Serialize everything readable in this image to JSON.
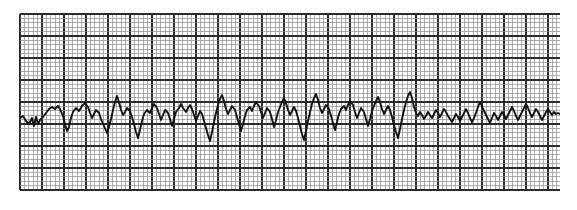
{
  "image": {
    "kind": "ecg-rhythm-strip",
    "width": 577,
    "height": 210,
    "background_color": "#ffffff"
  },
  "grid": {
    "label": "ECG graph paper grid",
    "x": 20,
    "y": 14,
    "width": 540,
    "height": 176,
    "small_square_px": 4.4,
    "heavy_every_n_squares": 5,
    "paper_color": "#ffffff",
    "fine_line_color": "#8c8c8c",
    "heavy_line_color": "#2b2b2b",
    "fine_line_width": 0.7,
    "heavy_line_width": 1.3,
    "time_per_small_square_s": 0.04,
    "time_per_heavy_square_s": 0.2,
    "mv_per_small_square": 0.1,
    "mv_per_heavy_square": 0.5
  },
  "trace": {
    "label": "ECG waveform trace",
    "color": "#121212",
    "line_width": 1.9,
    "baseline_y": 118,
    "rhythm": "irregularly irregular, no discernible P waves (coarse atrial fibrillation)",
    "points": [
      [
        20,
        118
      ],
      [
        23,
        116
      ],
      [
        26,
        121
      ],
      [
        29,
        124
      ],
      [
        32,
        118
      ],
      [
        34,
        126
      ],
      [
        36,
        117
      ],
      [
        38,
        124
      ],
      [
        40,
        120
      ],
      [
        43,
        117
      ],
      [
        46,
        113
      ],
      [
        49,
        109
      ],
      [
        52,
        107
      ],
      [
        55,
        109
      ],
      [
        58,
        106
      ],
      [
        60,
        109
      ],
      [
        63,
        116
      ],
      [
        65,
        124
      ],
      [
        67,
        131
      ],
      [
        69,
        127
      ],
      [
        71,
        118
      ],
      [
        73,
        112
      ],
      [
        76,
        108
      ],
      [
        79,
        111
      ],
      [
        82,
        106
      ],
      [
        85,
        103
      ],
      [
        88,
        107
      ],
      [
        90,
        113
      ],
      [
        92,
        118
      ],
      [
        94,
        114
      ],
      [
        96,
        110
      ],
      [
        99,
        113
      ],
      [
        101,
        119
      ],
      [
        104,
        126
      ],
      [
        107,
        133
      ],
      [
        109,
        127
      ],
      [
        111,
        119
      ],
      [
        113,
        110
      ],
      [
        115,
        102
      ],
      [
        117,
        96
      ],
      [
        119,
        102
      ],
      [
        121,
        110
      ],
      [
        123,
        115
      ],
      [
        125,
        112
      ],
      [
        127,
        108
      ],
      [
        130,
        111
      ],
      [
        132,
        117
      ],
      [
        134,
        124
      ],
      [
        136,
        132
      ],
      [
        138,
        138
      ],
      [
        140,
        130
      ],
      [
        142,
        121
      ],
      [
        144,
        114
      ],
      [
        147,
        110
      ],
      [
        150,
        113
      ],
      [
        152,
        108
      ],
      [
        154,
        104
      ],
      [
        157,
        108
      ],
      [
        159,
        114
      ],
      [
        161,
        120
      ],
      [
        163,
        115
      ],
      [
        165,
        110
      ],
      [
        168,
        113
      ],
      [
        170,
        119
      ],
      [
        172,
        126
      ],
      [
        174,
        119
      ],
      [
        176,
        112
      ],
      [
        179,
        108
      ],
      [
        181,
        104
      ],
      [
        183,
        108
      ],
      [
        186,
        112
      ],
      [
        188,
        108
      ],
      [
        190,
        105
      ],
      [
        192,
        109
      ],
      [
        194,
        115
      ],
      [
        196,
        121
      ],
      [
        198,
        116
      ],
      [
        200,
        111
      ],
      [
        202,
        114
      ],
      [
        204,
        121
      ],
      [
        206,
        128
      ],
      [
        208,
        135
      ],
      [
        210,
        141
      ],
      [
        212,
        132
      ],
      [
        214,
        122
      ],
      [
        216,
        113
      ],
      [
        218,
        105
      ],
      [
        220,
        99
      ],
      [
        222,
        95
      ],
      [
        224,
        101
      ],
      [
        226,
        109
      ],
      [
        228,
        114
      ],
      [
        230,
        110
      ],
      [
        232,
        106
      ],
      [
        235,
        110
      ],
      [
        237,
        117
      ],
      [
        239,
        124
      ],
      [
        241,
        131
      ],
      [
        243,
        124
      ],
      [
        245,
        116
      ],
      [
        247,
        110
      ],
      [
        250,
        107
      ],
      [
        252,
        111
      ],
      [
        254,
        106
      ],
      [
        256,
        102
      ],
      [
        259,
        106
      ],
      [
        261,
        112
      ],
      [
        263,
        118
      ],
      [
        265,
        113
      ],
      [
        267,
        108
      ],
      [
        270,
        112
      ],
      [
        272,
        119
      ],
      [
        274,
        127
      ],
      [
        276,
        120
      ],
      [
        278,
        112
      ],
      [
        280,
        107
      ],
      [
        282,
        102
      ],
      [
        284,
        98
      ],
      [
        286,
        103
      ],
      [
        288,
        110
      ],
      [
        290,
        115
      ],
      [
        292,
        111
      ],
      [
        294,
        107
      ],
      [
        296,
        111
      ],
      [
        298,
        118
      ],
      [
        300,
        126
      ],
      [
        302,
        134
      ],
      [
        304,
        140
      ],
      [
        306,
        131
      ],
      [
        308,
        121
      ],
      [
        310,
        112
      ],
      [
        312,
        104
      ],
      [
        314,
        98
      ],
      [
        316,
        94
      ],
      [
        318,
        100
      ],
      [
        320,
        108
      ],
      [
        322,
        113
      ],
      [
        324,
        109
      ],
      [
        326,
        105
      ],
      [
        329,
        109
      ],
      [
        331,
        116
      ],
      [
        333,
        123
      ],
      [
        335,
        130
      ],
      [
        337,
        122
      ],
      [
        339,
        114
      ],
      [
        341,
        109
      ],
      [
        344,
        106
      ],
      [
        346,
        110
      ],
      [
        348,
        105
      ],
      [
        350,
        101
      ],
      [
        353,
        105
      ],
      [
        355,
        112
      ],
      [
        357,
        118
      ],
      [
        359,
        113
      ],
      [
        361,
        108
      ],
      [
        364,
        112
      ],
      [
        366,
        119
      ],
      [
        368,
        126
      ],
      [
        370,
        119
      ],
      [
        372,
        111
      ],
      [
        374,
        106
      ],
      [
        376,
        101
      ],
      [
        378,
        97
      ],
      [
        380,
        102
      ],
      [
        382,
        109
      ],
      [
        384,
        114
      ],
      [
        386,
        110
      ],
      [
        388,
        106
      ],
      [
        390,
        110
      ],
      [
        392,
        117
      ],
      [
        394,
        125
      ],
      [
        396,
        132
      ],
      [
        398,
        138
      ],
      [
        400,
        129
      ],
      [
        402,
        119
      ],
      [
        404,
        110
      ],
      [
        406,
        102
      ],
      [
        408,
        96
      ],
      [
        410,
        92
      ],
      [
        412,
        98
      ],
      [
        414,
        107
      ],
      [
        416,
        113
      ],
      [
        418,
        116
      ],
      [
        420,
        112
      ],
      [
        422,
        115
      ],
      [
        424,
        119
      ],
      [
        426,
        116
      ],
      [
        428,
        112
      ],
      [
        430,
        115
      ],
      [
        432,
        118
      ],
      [
        434,
        114
      ],
      [
        436,
        110
      ],
      [
        438,
        113
      ],
      [
        440,
        117
      ],
      [
        442,
        113
      ],
      [
        444,
        109
      ],
      [
        446,
        112
      ],
      [
        448,
        116
      ],
      [
        450,
        119
      ],
      [
        452,
        122
      ],
      [
        454,
        118
      ],
      [
        456,
        114
      ],
      [
        458,
        117
      ],
      [
        460,
        121
      ],
      [
        462,
        117
      ],
      [
        464,
        113
      ],
      [
        466,
        109
      ],
      [
        468,
        113
      ],
      [
        470,
        118
      ],
      [
        472,
        122
      ],
      [
        474,
        118
      ],
      [
        476,
        113
      ],
      [
        478,
        107
      ],
      [
        480,
        102
      ],
      [
        482,
        106
      ],
      [
        484,
        111
      ],
      [
        486,
        115
      ],
      [
        488,
        119
      ],
      [
        490,
        123
      ],
      [
        492,
        118
      ],
      [
        494,
        113
      ],
      [
        496,
        116
      ],
      [
        498,
        120
      ],
      [
        500,
        116
      ],
      [
        502,
        112
      ],
      [
        504,
        115
      ],
      [
        506,
        119
      ],
      [
        508,
        115
      ],
      [
        510,
        111
      ],
      [
        512,
        107
      ],
      [
        514,
        111
      ],
      [
        516,
        116
      ],
      [
        518,
        120
      ],
      [
        520,
        116
      ],
      [
        522,
        112
      ],
      [
        524,
        108
      ],
      [
        526,
        104
      ],
      [
        528,
        108
      ],
      [
        530,
        113
      ],
      [
        532,
        117
      ],
      [
        534,
        113
      ],
      [
        536,
        109
      ],
      [
        538,
        112
      ],
      [
        540,
        116
      ],
      [
        542,
        120
      ],
      [
        544,
        116
      ],
      [
        546,
        112
      ],
      [
        548,
        109
      ],
      [
        550,
        112
      ],
      [
        552,
        115
      ],
      [
        554,
        112
      ],
      [
        556,
        114
      ],
      [
        558,
        113
      ],
      [
        560,
        114
      ]
    ]
  }
}
